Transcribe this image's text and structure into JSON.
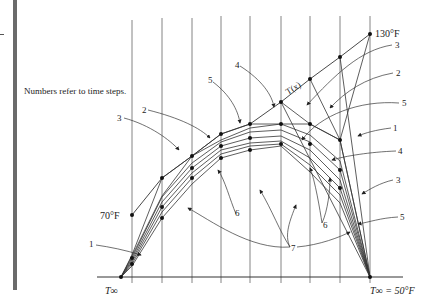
{
  "caption": "Numbers refer to time steps.",
  "labels": {
    "top_temp": "130°F",
    "left_temp": "70°F",
    "curve": "T(x)",
    "t_inf_left": "T∞",
    "t_inf_right": "T∞ = 50°F"
  },
  "step_labels": {
    "right": [
      "3",
      "2",
      "5",
      "1",
      "4",
      "3",
      "5"
    ],
    "left": [
      "2",
      "3",
      "1"
    ],
    "top": [
      "5",
      "4"
    ],
    "bottom": [
      "6",
      "6",
      "7"
    ]
  },
  "colors": {
    "line": "#333333",
    "grid": "#555555",
    "bar": "#6b6b6b"
  }
}
